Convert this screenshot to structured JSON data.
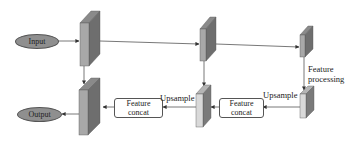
{
  "diagram": {
    "nodes": {
      "input": {
        "label": "Input",
        "shape": "ellipse"
      },
      "output": {
        "label": "Output",
        "shape": "ellipse"
      },
      "concat_left": {
        "line1": "Feature",
        "line2": "concat"
      },
      "concat_right": {
        "line1": "Feature",
        "line2": "concat"
      }
    },
    "labels": {
      "feature_processing_1": "Feature",
      "feature_processing_2": "processing",
      "upsample_left": "Upsample",
      "upsample_right": "Upsample"
    },
    "blocks": [
      {
        "id": "enc1",
        "role": "encoder feature map"
      },
      {
        "id": "enc2",
        "role": "encoder feature map"
      },
      {
        "id": "enc3",
        "role": "encoder feature map"
      },
      {
        "id": "dec3",
        "role": "processed feature map"
      },
      {
        "id": "dec2",
        "role": "upsampled feature map"
      },
      {
        "id": "dec1",
        "role": "output feature map"
      }
    ],
    "colors": {
      "block_front": "#a8a8a8",
      "block_side": "#6e6e6e",
      "block_top": "#8a8a8a",
      "block_front_light": "#d9d9d9",
      "ellipse_fill": "#8f8f8f",
      "line": "#444444"
    }
  }
}
